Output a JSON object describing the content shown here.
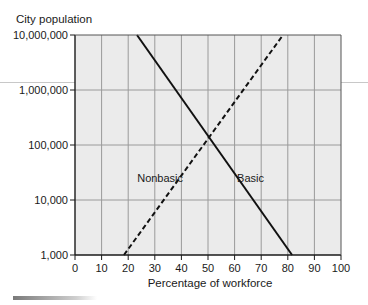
{
  "chart_data": {
    "type": "line",
    "title": "",
    "ylabel": "City population",
    "xlabel": "Percentage of workforce",
    "xlim": [
      0,
      100
    ],
    "ylim": [
      1000,
      10000000
    ],
    "yscale": "log",
    "grid": true,
    "x_ticks": [
      0,
      10,
      20,
      30,
      40,
      50,
      60,
      70,
      80,
      90,
      100
    ],
    "x_tick_labels": [
      "0",
      "10",
      "20",
      "30",
      "40",
      "50",
      "60",
      "70",
      "80",
      "90",
      "100"
    ],
    "y_ticks": [
      1000,
      10000,
      100000,
      1000000,
      10000000
    ],
    "y_tick_labels": [
      "1,000",
      "10,000",
      "100,000",
      "1,000,000",
      "10,000,000"
    ],
    "series": [
      {
        "name": "Basic",
        "style": "solid",
        "color": "#111111",
        "points": [
          {
            "x": 23.3,
            "y": 10000000
          },
          {
            "x": 81.6,
            "y": 1000
          }
        ]
      },
      {
        "name": "Nonbasic",
        "style": "dashed",
        "color": "#111111",
        "points": [
          {
            "x": 18.4,
            "y": 1000
          },
          {
            "x": 78.2,
            "y": 10000000
          }
        ]
      }
    ],
    "annotations": [
      {
        "text": "Nonbasic",
        "x": 32,
        "y": 25000
      },
      {
        "text": "Basic",
        "x": 66,
        "y": 25000
      }
    ]
  },
  "colors": {
    "plot_background": "#ebebeb",
    "grid": "#9a9a9a",
    "axis": "#1a1a1a"
  }
}
